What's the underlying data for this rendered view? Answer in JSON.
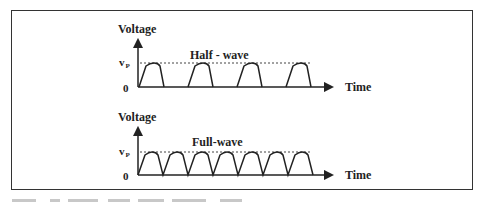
{
  "figure": {
    "frame_color": "#333333",
    "line_color": "#222222",
    "plots": [
      {
        "id": "half-wave",
        "title": "Half - wave",
        "y_label": "Voltage",
        "x_label": "Time",
        "vp_label": "v",
        "vp_subscript": "P",
        "zero_label": "0",
        "pulse_count": 4,
        "type": "half-wave rectified"
      },
      {
        "id": "full-wave",
        "title": "Full-wave",
        "y_label": "Voltage",
        "x_label": "Time",
        "vp_label": "v",
        "vp_subscript": "P",
        "zero_label": "0",
        "pulse_count": 7,
        "type": "full-wave rectified"
      }
    ]
  }
}
